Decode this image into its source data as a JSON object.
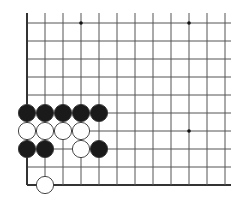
{
  "board": {
    "type": "go-diagram",
    "view": "bottom-left corner",
    "columns": 12,
    "rows": 10,
    "origin_x": 27,
    "origin_y": 23,
    "spacing": 18,
    "extends_top": true,
    "extends_right": true,
    "edge_left": true,
    "edge_bottom": true,
    "line_color": "#555555",
    "edge_color": "#333333",
    "star_points": [
      {
        "col": 3,
        "row": 0
      },
      {
        "col": 9,
        "row": 0
      },
      {
        "col": 9,
        "row": 6
      }
    ],
    "stones": [
      {
        "color": "black",
        "col": 0,
        "row": 5
      },
      {
        "color": "black",
        "col": 1,
        "row": 5
      },
      {
        "color": "black",
        "col": 2,
        "row": 5
      },
      {
        "color": "black",
        "col": 3,
        "row": 5
      },
      {
        "color": "black",
        "col": 4,
        "row": 5
      },
      {
        "color": "white",
        "col": 0,
        "row": 6
      },
      {
        "color": "white",
        "col": 1,
        "row": 6
      },
      {
        "color": "white",
        "col": 2,
        "row": 6
      },
      {
        "color": "white",
        "col": 3,
        "row": 6
      },
      {
        "color": "black",
        "col": 0,
        "row": 7
      },
      {
        "color": "black",
        "col": 1,
        "row": 7
      },
      {
        "color": "white",
        "col": 3,
        "row": 7
      },
      {
        "color": "black",
        "col": 4,
        "row": 7
      },
      {
        "color": "white",
        "col": 1,
        "row": 9
      }
    ],
    "colors": {
      "black_stone": "#1a1a1a",
      "white_stone": "#ffffff",
      "stone_outline": "#333333"
    }
  }
}
